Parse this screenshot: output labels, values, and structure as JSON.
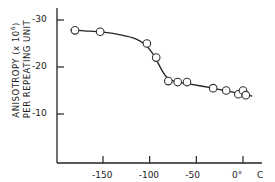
{
  "chart_data": {
    "type": "line",
    "title": "",
    "xlabel": "°C",
    "ylabel_line1": "ANISOTROPY (x 10^6)",
    "ylabel_line2": "PER REPEATING UNIT",
    "ylabel": "ANISOTROPY (x 10^6) PER REPEATING UNIT",
    "x_ticks": [
      -150,
      -100,
      -50,
      0
    ],
    "x_tick_labels": [
      "-150",
      "-100",
      "-50",
      "0°",
      "C"
    ],
    "y_ticks": [
      -30,
      -20,
      -10
    ],
    "y_tick_labels": [
      "-30",
      "-20",
      "-10"
    ],
    "xlim": [
      -195,
      15
    ],
    "ylim": [
      0,
      -33
    ],
    "grid": false,
    "legend": null,
    "series": [
      {
        "name": "Anisotropy",
        "marker": "open-circle",
        "x": [
          -180,
          -153,
          -103,
          -93,
          -80,
          -70,
          -60,
          -32,
          -18,
          -5,
          0,
          3
        ],
        "y": [
          -27.8,
          -27.5,
          -25.0,
          -22.0,
          -17.0,
          -16.8,
          -16.8,
          -15.5,
          -15.0,
          -14.2,
          -15.0,
          -14.0
        ]
      }
    ],
    "fit_curve": {
      "x": [
        -185,
        -170,
        -150,
        -130,
        -115,
        -105,
        -98,
        -92,
        -86,
        -80,
        -70,
        -55,
        -35,
        -20,
        -5,
        5,
        10
      ],
      "y": [
        -27.9,
        -27.7,
        -27.4,
        -26.8,
        -26.0,
        -24.8,
        -23.2,
        -21.2,
        -19.0,
        -17.5,
        -16.8,
        -16.3,
        -15.6,
        -15.0,
        -14.4,
        -14.0,
        -13.8
      ]
    }
  }
}
